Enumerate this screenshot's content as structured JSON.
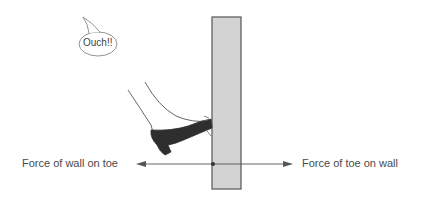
{
  "diagram": {
    "speech_bubble": {
      "text": "Ouch!!"
    },
    "labels": {
      "left_force": "Force of wall on toe",
      "right_force": "Force of toe on wall"
    },
    "elements": {
      "wall": {
        "fill": "#d3d3d3",
        "stroke": "#555555"
      },
      "shoe": {
        "fill": "#2e2e2e"
      },
      "arrow_color": "#555555"
    }
  }
}
